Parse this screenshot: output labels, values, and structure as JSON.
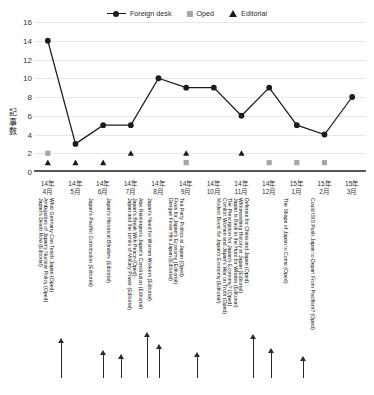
{
  "watermark": "",
  "legend": [
    {
      "label": "Foreign desk",
      "marker": "line-circle-marker",
      "color": "#1c1c1c"
    },
    {
      "label": "Oped",
      "marker": "square-marker",
      "color": "#a6a6a6"
    },
    {
      "label": "Editorial",
      "marker": "triangle-marker",
      "color": "#1c1c1c"
    }
  ],
  "chart_data": {
    "type": "line",
    "title": "",
    "xlabel": "",
    "ylabel": "記事数",
    "ylim": [
      0,
      16
    ],
    "yticks": [
      0,
      2,
      4,
      6,
      8,
      10,
      12,
      14,
      16
    ],
    "grid": true,
    "legend_position": "top-center",
    "categories": [
      "14年\n4月",
      "14年\n5月",
      "14年\n6月",
      "14年\n7月",
      "14年\n8月",
      "14年\n9月",
      "14年\n10月",
      "14年\n11月",
      "14年\n12月",
      "15年\n1月",
      "15年\n2月",
      "15年\n3月"
    ],
    "categories_display": [
      [
        "14年",
        "4月"
      ],
      [
        "14年",
        "5月"
      ],
      [
        "14年",
        "6月"
      ],
      [
        "14年",
        "7月"
      ],
      [
        "14年",
        "8月"
      ],
      [
        "14年",
        "9月"
      ],
      [
        "14年",
        "10月"
      ],
      [
        "14年",
        "11月"
      ],
      [
        "14年",
        "12月"
      ],
      [
        "15年",
        "1月"
      ],
      [
        "15年",
        "2月"
      ],
      [
        "15年",
        "3月"
      ]
    ],
    "series": [
      {
        "name": "Foreign desk",
        "marker": "circle",
        "color": "#1c1c1c",
        "values": [
          14,
          3,
          5,
          5,
          10,
          9,
          9,
          6,
          9,
          5,
          4,
          8
        ]
      },
      {
        "name": "Oped",
        "marker": "square",
        "color": "#a6a6a6",
        "values": [
          2,
          null,
          null,
          null,
          null,
          1,
          null,
          null,
          1,
          1,
          1,
          null
        ]
      },
      {
        "name": "Editorial",
        "marker": "triangle",
        "color": "#1c1c1c",
        "values": [
          1,
          1,
          1,
          2,
          null,
          2,
          null,
          2,
          null,
          null,
          null,
          null
        ]
      }
    ],
    "annotations": [
      {
        "text": "Japan's Death Row (Editorial)",
        "month": "14年4月"
      },
      {
        "text": "Ambiguities of Japan's Nuclear Policy (Oped)",
        "month": "14年4月"
      },
      {
        "text": "What Germany Can Teach Japan (Oped)",
        "month": "14年4月"
      },
      {
        "text": "Japan's Pacifist Constitution (Editorial)",
        "month": "14年5月"
      },
      {
        "text": "Japan's Historical Blinders (Editorial)",
        "month": "14年6月"
      },
      {
        "text": "Japan and the Limits of Military Power (Editorial)",
        "month": "14年7月"
      },
      {
        "text": "Japan's Break With Peace (Oped)",
        "month": "14年7月"
      },
      {
        "text": "Abe Reinterprets Japan's Constitution (Editorial)",
        "month": "14年7月"
      },
      {
        "text": "Japan's Need for Women Workers (Editorial)",
        "month": "14年8月"
      },
      {
        "text": "Dengue Fever Hits Japan (Editorial)",
        "month": "14年9月"
      },
      {
        "text": "Fixes for Japan's Economy (Editorial)",
        "month": "14年9月"
      },
      {
        "text": "Tea Party Politics in Japan (Oped)",
        "month": "14年9月"
      },
      {
        "text": "Modest Boost for Japan's Economy (Editorial)",
        "month": "14年11月"
      },
      {
        "text": "Comfort Women and Japan's War on Truth (Oped)",
        "month": "14年11月"
      },
      {
        "text": "The Prescription for Japan's Economy? (Oped)",
        "month": "14年11月"
      },
      {
        "text": "Japan Is Back in the Hunt for Whales (Editorial)",
        "month": "14年11月"
      },
      {
        "text": "Whitewashing History in Japan (Editorial)",
        "month": "14年12月"
      },
      {
        "text": "Defense for China and Japan (Oped)",
        "month": "14年12月"
      },
      {
        "text": "The Shape of Japan to Come (Oped)",
        "month": "15年1月"
      },
      {
        "text": "Could ISIS Push Japan to Depart From Pacifism? (Oped)",
        "month": "15年2月"
      }
    ],
    "arrow_months": [
      "14年4月",
      "14年5月",
      "14年6月",
      "14年7月",
      "14年7月",
      "14年11月",
      "14年12月",
      "15年1月"
    ]
  }
}
